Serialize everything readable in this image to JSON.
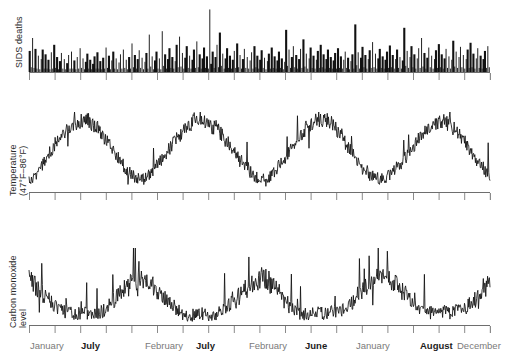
{
  "figure": {
    "background": "#ffffff",
    "ink_color": "#111111",
    "axis_color": "#6e6e6e",
    "tick_color": "#8a8a8a",
    "label_color": "#7a7a7a",
    "label_color_emphasis": "#1c1c1c"
  },
  "panels": [
    {
      "id": "sids-deaths",
      "ylabel_line1": "SIDS deaths",
      "ylabel_line2": "",
      "type": "spike"
    },
    {
      "id": "temperature",
      "ylabel_line1": "Temperature",
      "ylabel_line2": "(47°F–86°F)",
      "type": "line"
    },
    {
      "id": "carbon-monoxide",
      "ylabel_line1": "Carbon monoxide",
      "ylabel_line2": "level",
      "type": "line"
    }
  ],
  "xaxis": {
    "ticks_count": 19,
    "tick_spacing_px": 25.6,
    "labels": [
      {
        "text": "January",
        "x": 30,
        "emphasis": false
      },
      {
        "text": "July",
        "x": 81,
        "emphasis": true
      },
      {
        "text": "February",
        "x": 145,
        "emphasis": false
      },
      {
        "text": "July",
        "x": 196,
        "emphasis": true
      },
      {
        "text": "February",
        "x": 249,
        "emphasis": false
      },
      {
        "text": "June",
        "x": 305,
        "emphasis": true
      },
      {
        "text": "January",
        "x": 356,
        "emphasis": false
      },
      {
        "text": "August",
        "x": 420,
        "emphasis": true
      },
      {
        "text": "December",
        "x": 457,
        "emphasis": false
      }
    ]
  },
  "chart_data": {
    "type": "line",
    "title": "",
    "subtitle": "",
    "xlabel": "",
    "grid": false,
    "legend": "none",
    "x_axis": {
      "label": "",
      "tick_labels": [
        "January",
        "July",
        "February",
        "July",
        "February",
        "June",
        "January",
        "August",
        "December"
      ],
      "range_description": "continuous daily series spanning roughly four years"
    },
    "charts": [
      {
        "id": "sids-deaths",
        "type": "bar",
        "ylabel": "SIDS deaths",
        "ylim": [
          0,
          1
        ],
        "values": [
          0.31,
          0.07,
          0.5,
          0.06,
          0.34,
          0.05,
          0.24,
          0.04,
          0.19,
          0.33,
          0.05,
          0.26,
          0.05,
          0.18,
          0.04,
          0.29,
          0.05,
          0.4,
          0.06,
          0.22,
          0.04,
          0.16,
          0.28,
          0.05,
          0.19,
          0.04,
          0.13,
          0.25,
          0.05,
          0.3,
          0.05,
          0.17,
          0.04,
          0.22,
          0.05,
          0.35,
          0.06,
          0.2,
          0.04,
          0.15,
          0.27,
          0.05,
          0.18,
          0.04,
          0.12,
          0.23,
          0.05,
          0.29,
          0.05,
          0.16,
          0.04,
          0.21,
          0.05,
          0.36,
          0.06,
          0.24,
          0.04,
          0.17,
          0.3,
          0.05,
          0.2,
          0.04,
          0.14,
          0.26,
          0.05,
          0.33,
          0.06,
          0.18,
          0.04,
          0.22,
          0.05,
          0.42,
          0.07,
          0.25,
          0.05,
          0.19,
          0.32,
          0.06,
          0.21,
          0.04,
          0.15,
          0.28,
          0.05,
          0.55,
          0.08,
          0.23,
          0.04,
          0.17,
          0.3,
          0.05,
          0.2,
          0.04,
          0.6,
          0.09,
          0.26,
          0.05,
          0.19,
          0.35,
          0.06,
          0.22,
          0.05,
          0.16,
          0.4,
          0.07,
          0.52,
          0.08,
          0.28,
          0.05,
          0.21,
          0.38,
          0.06,
          0.24,
          0.05,
          0.18,
          0.33,
          0.06,
          0.45,
          0.07,
          0.26,
          0.05,
          0.2,
          0.36,
          0.06,
          0.23,
          0.05,
          0.92,
          0.12,
          0.3,
          0.06,
          0.22,
          0.4,
          0.07,
          0.58,
          0.09,
          0.27,
          0.05,
          0.2,
          0.35,
          0.06,
          0.24,
          0.05,
          0.18,
          0.31,
          0.06,
          0.42,
          0.07,
          0.25,
          0.05,
          0.19,
          0.34,
          0.06,
          0.22,
          0.05,
          0.17,
          0.29,
          0.05,
          0.38,
          0.07,
          0.24,
          0.05,
          0.18,
          0.32,
          0.06,
          0.21,
          0.04,
          0.16,
          0.27,
          0.05,
          0.36,
          0.06,
          0.23,
          0.05,
          0.17,
          0.3,
          0.06,
          0.2,
          0.04,
          0.15,
          0.62,
          0.09,
          0.33,
          0.06,
          0.22,
          0.38,
          0.07,
          0.25,
          0.05,
          0.19,
          0.34,
          0.06,
          0.48,
          0.08,
          0.27,
          0.05,
          0.2,
          0.36,
          0.06,
          0.24,
          0.05,
          0.18,
          0.31,
          0.06,
          0.4,
          0.07,
          0.26,
          0.05,
          0.19,
          0.33,
          0.06,
          0.22,
          0.05,
          0.17,
          0.28,
          0.05,
          0.35,
          0.06,
          0.23,
          0.05,
          0.18,
          0.3,
          0.06,
          0.21,
          0.04,
          0.16,
          0.26,
          0.05,
          0.7,
          0.1,
          0.29,
          0.05,
          0.21,
          0.37,
          0.07,
          0.25,
          0.05,
          0.19,
          0.32,
          0.06,
          0.44,
          0.07,
          0.27,
          0.05,
          0.2,
          0.34,
          0.06,
          0.23,
          0.05,
          0.18,
          0.3,
          0.06,
          0.39,
          0.07,
          0.25,
          0.05,
          0.19,
          0.33,
          0.06,
          0.22,
          0.05,
          0.17,
          0.65,
          0.09,
          0.31,
          0.06,
          0.22,
          0.38,
          0.07,
          0.26,
          0.05,
          0.2,
          0.35,
          0.06,
          0.5,
          0.08,
          0.28,
          0.05,
          0.21,
          0.36,
          0.07,
          0.24,
          0.05,
          0.19,
          0.32,
          0.06,
          0.41,
          0.07,
          0.26,
          0.05,
          0.2,
          0.34,
          0.06,
          0.23,
          0.05,
          0.18,
          0.46,
          0.08,
          0.3,
          0.06,
          0.22,
          0.37,
          0.07,
          0.25,
          0.05,
          0.19,
          0.33,
          0.06,
          0.43,
          0.07,
          0.27,
          0.05,
          0.2,
          0.35,
          0.06,
          0.24,
          0.05,
          0.19,
          0.31,
          0.06,
          0.38,
          0.07
        ],
        "note": "tall narrow spikes on a dense daily baseline; no visible y tick labels"
      },
      {
        "id": "temperature",
        "type": "line",
        "ylabel": "Temperature (47°F–86°F)",
        "ylim": [
          47,
          86
        ],
        "seasonal_cycles": 4,
        "summer_peak_label": "July",
        "winter_trough_label": "February",
        "note": "strong annual sinusoid, amplitude ~ full 47°F–86°F band, with high-frequency daily noise"
      },
      {
        "id": "carbon-monoxide",
        "type": "line",
        "ylabel": "Carbon monoxide level",
        "ylim": [
          0,
          1
        ],
        "seasonal_cycles": 4,
        "peak_season": "winter",
        "note": "anti-phase with temperature; sharp winter spikes, flat low summers"
      }
    ]
  }
}
